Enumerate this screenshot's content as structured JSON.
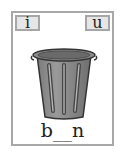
{
  "card": {
    "options": [
      {
        "letter": "i"
      },
      {
        "letter": "u"
      }
    ],
    "image": {
      "icon": "trash-bin-icon"
    },
    "word": "b__n"
  }
}
